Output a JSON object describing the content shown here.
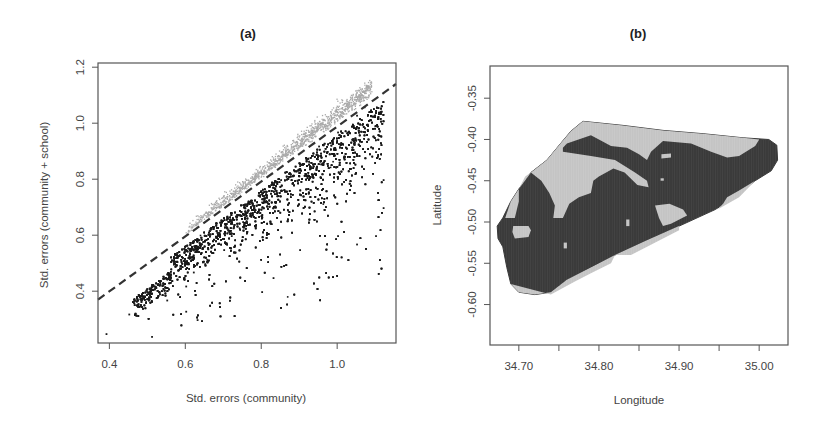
{
  "chart_data": [
    {
      "id": "a",
      "type": "scatter",
      "title": "(a)",
      "xlabel": "Std. errors (community)",
      "ylabel": "Std. errors (community + school)",
      "xlim": [
        0.37,
        1.155
      ],
      "ylim": [
        0.215,
        1.215
      ],
      "xticks": [
        0.4,
        0.6,
        0.8,
        1.0
      ],
      "xtick_labels": [
        "0.4",
        "0.6",
        "0.8",
        "1.0"
      ],
      "yticks": [
        0.4,
        0.6,
        0.8,
        1.0,
        1.2
      ],
      "ytick_labels": [
        "0.4",
        "0.6",
        "0.8",
        "1.0",
        "1.2"
      ],
      "grid": false,
      "legend": null,
      "reference_line": {
        "style": "dashed",
        "color": "#333333",
        "x": [
          0.37,
          1.155
        ],
        "y": [
          0.37,
          1.14
        ],
        "description": "y = x line"
      },
      "series": [
        {
          "name": "below line (community + school SE smaller)",
          "color": "#1a1a1a",
          "approx_count": 4500,
          "description": "dense black cloud from (0.45,0.30) to (1.10,1.05); band under the y=x line with spread toward lower-right",
          "sample_points": [
            [
              0.39,
              0.25
            ],
            [
              0.51,
              0.24
            ],
            [
              0.45,
              0.32
            ],
            [
              0.48,
              0.35
            ],
            [
              0.55,
              0.37
            ],
            [
              0.6,
              0.42
            ],
            [
              0.62,
              0.47
            ],
            [
              0.65,
              0.5
            ],
            [
              0.7,
              0.55
            ],
            [
              0.72,
              0.6
            ],
            [
              0.75,
              0.65
            ],
            [
              0.78,
              0.7
            ],
            [
              0.8,
              0.72
            ],
            [
              0.85,
              0.8
            ],
            [
              0.9,
              0.85
            ],
            [
              0.95,
              0.92
            ],
            [
              1.0,
              0.97
            ],
            [
              1.05,
              1.03
            ],
            [
              1.07,
              1.06
            ],
            [
              1.1,
              0.9
            ],
            [
              1.12,
              0.8
            ],
            [
              1.1,
              0.6
            ],
            [
              1.05,
              0.57
            ],
            [
              1.0,
              0.6
            ],
            [
              0.9,
              0.55
            ],
            [
              0.8,
              0.4
            ],
            [
              0.83,
              0.45
            ],
            [
              0.63,
              0.3
            ],
            [
              0.6,
              0.33
            ],
            [
              1.12,
              0.7
            ]
          ]
        },
        {
          "name": "above line (community + school SE larger)",
          "color": "#a9a9a9",
          "approx_count": 1200,
          "description": "light grey band just above the y=x line from (0.6,0.62) to (1.09,1.17)",
          "sample_points": [
            [
              0.6,
              0.62
            ],
            [
              0.65,
              0.66
            ],
            [
              0.7,
              0.71
            ],
            [
              0.75,
              0.76
            ],
            [
              0.8,
              0.82
            ],
            [
              0.85,
              0.88
            ],
            [
              0.9,
              0.94
            ],
            [
              0.95,
              1.0
            ],
            [
              1.0,
              1.06
            ],
            [
              1.05,
              1.13
            ],
            [
              1.08,
              1.17
            ],
            [
              1.07,
              1.15
            ],
            [
              0.97,
              1.04
            ],
            [
              0.88,
              0.93
            ],
            [
              0.78,
              0.8
            ]
          ]
        }
      ]
    },
    {
      "id": "b",
      "type": "heatmap",
      "title": "(b)",
      "xlabel": "Longitude",
      "ylabel": "Latitude",
      "xlim": [
        34.664,
        35.036
      ],
      "ylim": [
        -0.649,
        -0.311
      ],
      "xticks": [
        34.7,
        34.75,
        34.8,
        34.85,
        34.9,
        34.95,
        35.0
      ],
      "xtick_labels": [
        "34.70",
        "",
        "34.80",
        "",
        "34.90",
        "",
        "35.00"
      ],
      "yticks": [
        -0.35,
        -0.4,
        -0.45,
        -0.5,
        -0.55,
        -0.6
      ],
      "ytick_labels": [
        "-0.35",
        "-0.40",
        "-0.45",
        "-0.50",
        "-0.55",
        "-0.60"
      ],
      "grid": false,
      "legend": null,
      "categories": [
        {
          "name": "dark",
          "color": "#3a3a3a"
        },
        {
          "name": "light",
          "color": "#c4c4c4"
        }
      ],
      "region_outline": [
        [
          34.78,
          -0.378
        ],
        [
          34.83,
          -0.383
        ],
        [
          34.88,
          -0.389
        ],
        [
          34.93,
          -0.393
        ],
        [
          34.98,
          -0.398
        ],
        [
          35.012,
          -0.4
        ],
        [
          35.022,
          -0.407
        ],
        [
          35.023,
          -0.425
        ],
        [
          35.015,
          -0.438
        ],
        [
          34.995,
          -0.45
        ],
        [
          34.97,
          -0.47
        ],
        [
          34.945,
          -0.485
        ],
        [
          34.9,
          -0.505
        ],
        [
          34.86,
          -0.522
        ],
        [
          34.82,
          -0.54
        ],
        [
          34.79,
          -0.555
        ],
        [
          34.76,
          -0.57
        ],
        [
          34.74,
          -0.585
        ],
        [
          34.72,
          -0.588
        ],
        [
          34.7,
          -0.585
        ],
        [
          34.69,
          -0.575
        ],
        [
          34.685,
          -0.555
        ],
        [
          34.68,
          -0.53
        ],
        [
          34.674,
          -0.52
        ],
        [
          34.673,
          -0.505
        ],
        [
          34.68,
          -0.495
        ],
        [
          34.69,
          -0.475
        ],
        [
          34.7,
          -0.46
        ],
        [
          34.715,
          -0.44
        ],
        [
          34.735,
          -0.425
        ],
        [
          34.752,
          -0.405
        ],
        [
          34.765,
          -0.39
        ]
      ],
      "light_patches": [
        [
          [
            34.752,
            -0.405
          ],
          [
            34.765,
            -0.39
          ],
          [
            34.78,
            -0.378
          ],
          [
            34.83,
            -0.383
          ],
          [
            34.88,
            -0.389
          ],
          [
            34.93,
            -0.393
          ],
          [
            34.98,
            -0.398
          ],
          [
            35.0,
            -0.4
          ],
          [
            34.995,
            -0.408
          ],
          [
            34.975,
            -0.42
          ],
          [
            34.96,
            -0.422
          ],
          [
            34.94,
            -0.415
          ],
          [
            34.915,
            -0.405
          ],
          [
            34.88,
            -0.402
          ],
          [
            34.865,
            -0.415
          ],
          [
            34.86,
            -0.425
          ],
          [
            34.85,
            -0.418
          ],
          [
            34.835,
            -0.41
          ],
          [
            34.815,
            -0.408
          ],
          [
            34.8,
            -0.4
          ],
          [
            34.79,
            -0.395
          ],
          [
            34.76,
            -0.405
          ],
          [
            34.755,
            -0.41
          ],
          [
            34.755,
            -0.415
          ],
          [
            34.79,
            -0.42
          ],
          [
            34.82,
            -0.425
          ],
          [
            34.845,
            -0.44
          ],
          [
            34.86,
            -0.45
          ],
          [
            34.862,
            -0.458
          ],
          [
            34.848,
            -0.455
          ],
          [
            34.832,
            -0.44
          ],
          [
            34.818,
            -0.435
          ],
          [
            34.8,
            -0.445
          ],
          [
            34.793,
            -0.45
          ],
          [
            34.79,
            -0.465
          ],
          [
            34.775,
            -0.47
          ],
          [
            34.763,
            -0.478
          ],
          [
            34.755,
            -0.495
          ],
          [
            34.743,
            -0.495
          ],
          [
            34.745,
            -0.48
          ],
          [
            34.738,
            -0.465
          ],
          [
            34.728,
            -0.45
          ],
          [
            34.715,
            -0.44
          ],
          [
            34.735,
            -0.425
          ]
        ],
        [
          [
            34.715,
            -0.44
          ],
          [
            34.7,
            -0.46
          ],
          [
            34.69,
            -0.475
          ],
          [
            34.683,
            -0.495
          ],
          [
            34.695,
            -0.495
          ],
          [
            34.7,
            -0.475
          ],
          [
            34.7,
            -0.46
          ],
          [
            34.708,
            -0.445
          ]
        ],
        [
          [
            34.693,
            -0.505
          ],
          [
            34.712,
            -0.505
          ],
          [
            34.715,
            -0.51
          ],
          [
            34.712,
            -0.518
          ],
          [
            34.695,
            -0.52
          ],
          [
            34.692,
            -0.512
          ]
        ],
        [
          [
            34.87,
            -0.48
          ],
          [
            34.888,
            -0.478
          ],
          [
            34.905,
            -0.485
          ],
          [
            34.91,
            -0.492
          ],
          [
            34.89,
            -0.502
          ],
          [
            34.88,
            -0.505
          ],
          [
            34.875,
            -0.495
          ]
        ],
        [
          [
            34.96,
            -0.47
          ],
          [
            34.975,
            -0.462
          ],
          [
            34.995,
            -0.45
          ],
          [
            34.975,
            -0.47
          ],
          [
            34.948,
            -0.485
          ],
          [
            34.955,
            -0.478
          ]
        ],
        [
          [
            34.69,
            -0.575
          ],
          [
            34.7,
            -0.585
          ],
          [
            34.72,
            -0.588
          ],
          [
            34.74,
            -0.585
          ],
          [
            34.76,
            -0.57
          ],
          [
            34.79,
            -0.555
          ],
          [
            34.82,
            -0.54
          ],
          [
            34.815,
            -0.55
          ],
          [
            34.79,
            -0.562
          ],
          [
            34.77,
            -0.572
          ],
          [
            34.74,
            -0.588
          ]
        ],
        [
          [
            34.878,
            -0.418
          ],
          [
            34.89,
            -0.417
          ],
          [
            34.89,
            -0.422
          ],
          [
            34.878,
            -0.423
          ]
        ],
        [
          [
            34.877,
            -0.447
          ],
          [
            34.881,
            -0.447
          ],
          [
            34.881,
            -0.45
          ],
          [
            34.877,
            -0.45
          ]
        ],
        [
          [
            34.834,
            -0.497
          ],
          [
            34.838,
            -0.497
          ],
          [
            34.838,
            -0.505
          ],
          [
            34.834,
            -0.505
          ]
        ],
        [
          [
            34.756,
            -0.525
          ],
          [
            34.76,
            -0.525
          ],
          [
            34.76,
            -0.532
          ],
          [
            34.756,
            -0.532
          ]
        ],
        [
          [
            34.84,
            -0.54
          ],
          [
            34.9,
            -0.51
          ],
          [
            34.9,
            -0.505
          ],
          [
            34.86,
            -0.522
          ],
          [
            34.82,
            -0.54
          ]
        ]
      ]
    }
  ]
}
